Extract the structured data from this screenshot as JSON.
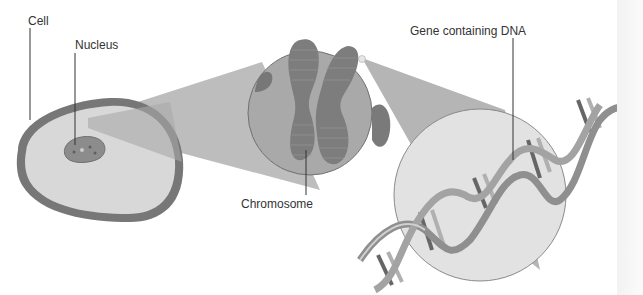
{
  "diagram": {
    "labels": {
      "cell": "Cell",
      "nucleus": "Nucleus",
      "chromosome": "Chromosome",
      "gene": "Gene containing DNA"
    },
    "colors": {
      "background": "#ffffff",
      "cell_membrane": "#777777",
      "cytoplasm": "#d6d6d6",
      "nucleus": "#8a8a8a",
      "zoom_cone": "#b8b8b8",
      "chromosome_circle": "#a9a9a9",
      "chromosome": "#7d7d7d",
      "dna_circle": "#e2e2e2",
      "dna_strand": "#8f8f8f",
      "label_text": "#333333",
      "leader_line": "#333333"
    },
    "stages": [
      "Cell",
      "Nucleus",
      "Chromosome",
      "Gene containing DNA"
    ]
  }
}
